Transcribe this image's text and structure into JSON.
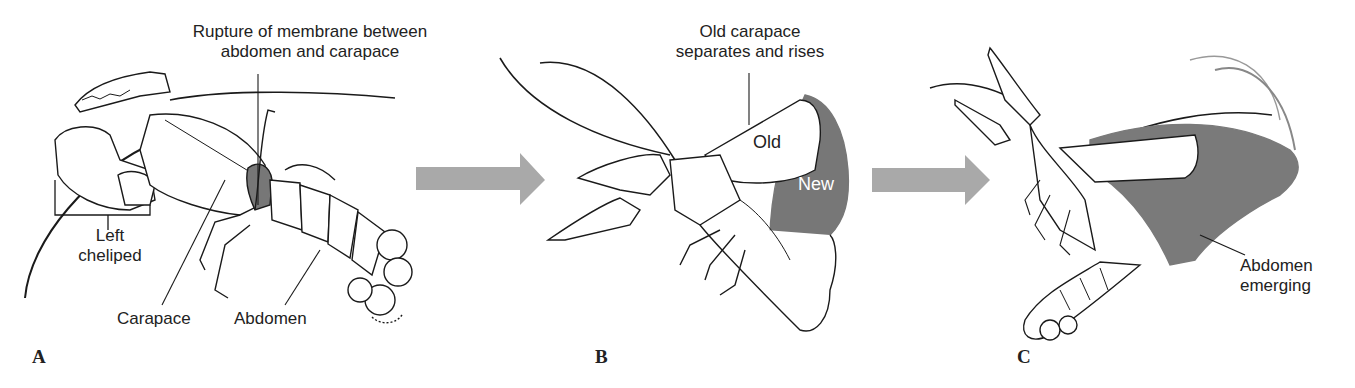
{
  "figure": {
    "panels": [
      {
        "letter": "A",
        "labels": {
          "rupture_line1": "Rupture of membrane between",
          "rupture_line2": "abdomen and carapace",
          "left_cheliped_line1": "Left",
          "left_cheliped_line2": "cheliped",
          "carapace": "Carapace",
          "abdomen": "Abdomen"
        }
      },
      {
        "letter": "B",
        "labels": {
          "old_carapace_line1": "Old carapace",
          "old_carapace_line2": "separates and rises",
          "old": "Old",
          "new": "New"
        }
      },
      {
        "letter": "C",
        "labels": {
          "abdomen_emerging_line1": "Abdomen",
          "abdomen_emerging_line2": "emerging"
        }
      }
    ],
    "arrows": [
      {
        "from": "A",
        "to": "B"
      },
      {
        "from": "B",
        "to": "C"
      }
    ],
    "colors": {
      "arrow": "#a9a9a9",
      "new_shell": "#777777",
      "line": "#1a1a1a",
      "text": "#222222"
    }
  }
}
